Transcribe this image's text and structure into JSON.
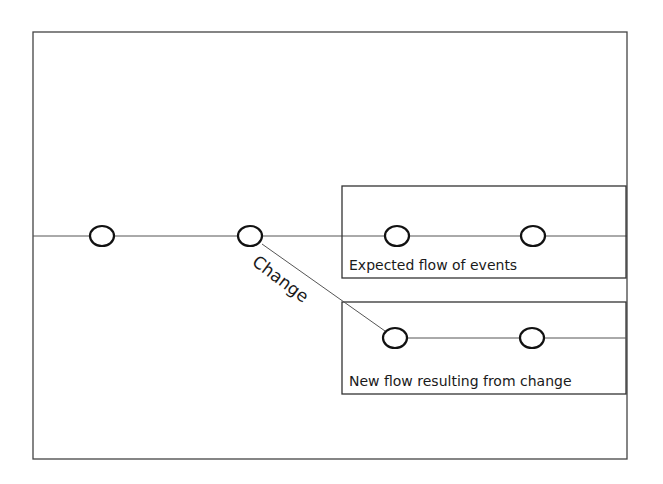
{
  "diagram": {
    "type": "flow-comparison",
    "frame": {
      "x": 33,
      "y": 32,
      "width": 594,
      "height": 427
    },
    "main_line": {
      "y": 236,
      "x1": 33,
      "x2": 627
    },
    "events_main": [
      {
        "id": "e1",
        "cx": 102,
        "cy": 236
      },
      {
        "id": "e2",
        "cx": 250,
        "cy": 236
      }
    ],
    "change": {
      "label": "Change",
      "from": {
        "x": 262,
        "y": 244
      },
      "to": {
        "x": 385,
        "y": 331
      },
      "label_x": 283,
      "label_y": 262,
      "label_rotation": 37
    },
    "expected_box": {
      "x": 342,
      "y": 186,
      "width": 284,
      "height": 92,
      "label": "Expected flow of events",
      "events": [
        {
          "id": "x1",
          "cx": 397,
          "cy": 236
        },
        {
          "id": "x2",
          "cx": 533,
          "cy": 236
        }
      ]
    },
    "new_box": {
      "x": 342,
      "y": 302,
      "width": 284,
      "height": 92,
      "label": "New flow resulting from change",
      "line_y": 338,
      "events": [
        {
          "id": "n1",
          "cx": 395,
          "cy": 338
        },
        {
          "id": "n2",
          "cx": 532,
          "cy": 338
        }
      ]
    },
    "colors": {
      "stroke": "#111111",
      "line": "#555555",
      "background": "#ffffff"
    }
  }
}
